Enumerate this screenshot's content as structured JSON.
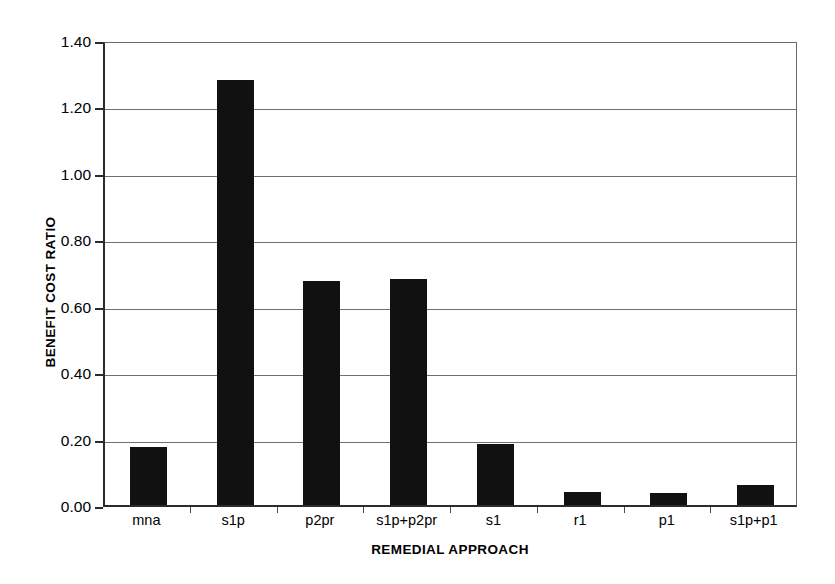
{
  "chart_data": {
    "type": "bar",
    "title": "",
    "xlabel": "REMEDIAL APPROACH",
    "ylabel": "BENEFIT COST RATIO",
    "categories": [
      "mna",
      "s1p",
      "p2pr",
      "s1p+p2pr",
      "s1",
      "r1",
      "p1",
      "s1p+p1"
    ],
    "values": [
      0.175,
      1.28,
      0.675,
      0.68,
      0.185,
      0.04,
      0.035,
      0.06
    ],
    "ylim": [
      0.0,
      1.4
    ],
    "ytick_values": [
      0.0,
      0.2,
      0.4,
      0.6,
      0.8,
      1.0,
      1.2,
      1.4
    ],
    "ytick_labels": [
      "0.00",
      "0.20",
      "0.40",
      "0.60",
      "0.80",
      "1.00",
      "1.20",
      "1.40"
    ],
    "grid": "horizontal",
    "legend": "none",
    "bar_color": "#111111",
    "axis_color": "#2b2b2b",
    "grid_color": "#707070",
    "background_color": "#ffffff"
  }
}
